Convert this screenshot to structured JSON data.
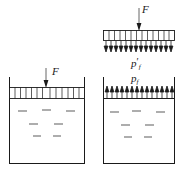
{
  "figure": {
    "type": "physics-diagram",
    "stroke_color": "#1a1a1a",
    "background_color": "#ffffff"
  },
  "labels": {
    "force_top": "F",
    "force_left": "F",
    "pressure_piston": "p",
    "pressure_piston_sub": "f",
    "pressure_piston_prime": "′",
    "pressure_fluid": "p",
    "pressure_fluid_sub": "f"
  },
  "panels": {
    "piston_free_body": {
      "name": "piston-free-body-diagram",
      "bar": {
        "x": 103,
        "y": 30,
        "width": 72,
        "height": 11,
        "segments": 13
      },
      "force_arrow": {
        "x": 139,
        "y_start": 8,
        "y_end": 30,
        "direction": "down"
      },
      "reaction_arrows": {
        "count": 14,
        "y_start": 42,
        "y_end": 52,
        "direction": "down"
      }
    },
    "container_left": {
      "name": "container-with-piston",
      "box": {
        "x": 9,
        "y": 86,
        "width": 76,
        "height": 78
      },
      "wall_top": 77,
      "piston": {
        "x": 10,
        "y": 87,
        "width": 74,
        "height": 12,
        "segments": 13
      },
      "force_arrow": {
        "x": 46,
        "y_start": 68,
        "y_end": 87,
        "direction": "down"
      },
      "fluid_marks": [
        3,
        2,
        2
      ]
    },
    "container_right": {
      "name": "container-with-fluid-pressure",
      "box": {
        "x": 103,
        "y": 98,
        "width": 72,
        "height": 66
      },
      "wall_top": 77,
      "pressure_arrows": {
        "count": 13,
        "y_start": 98,
        "y_end": 86,
        "direction": "up"
      },
      "fluid_marks": [
        3,
        2,
        2
      ]
    }
  }
}
